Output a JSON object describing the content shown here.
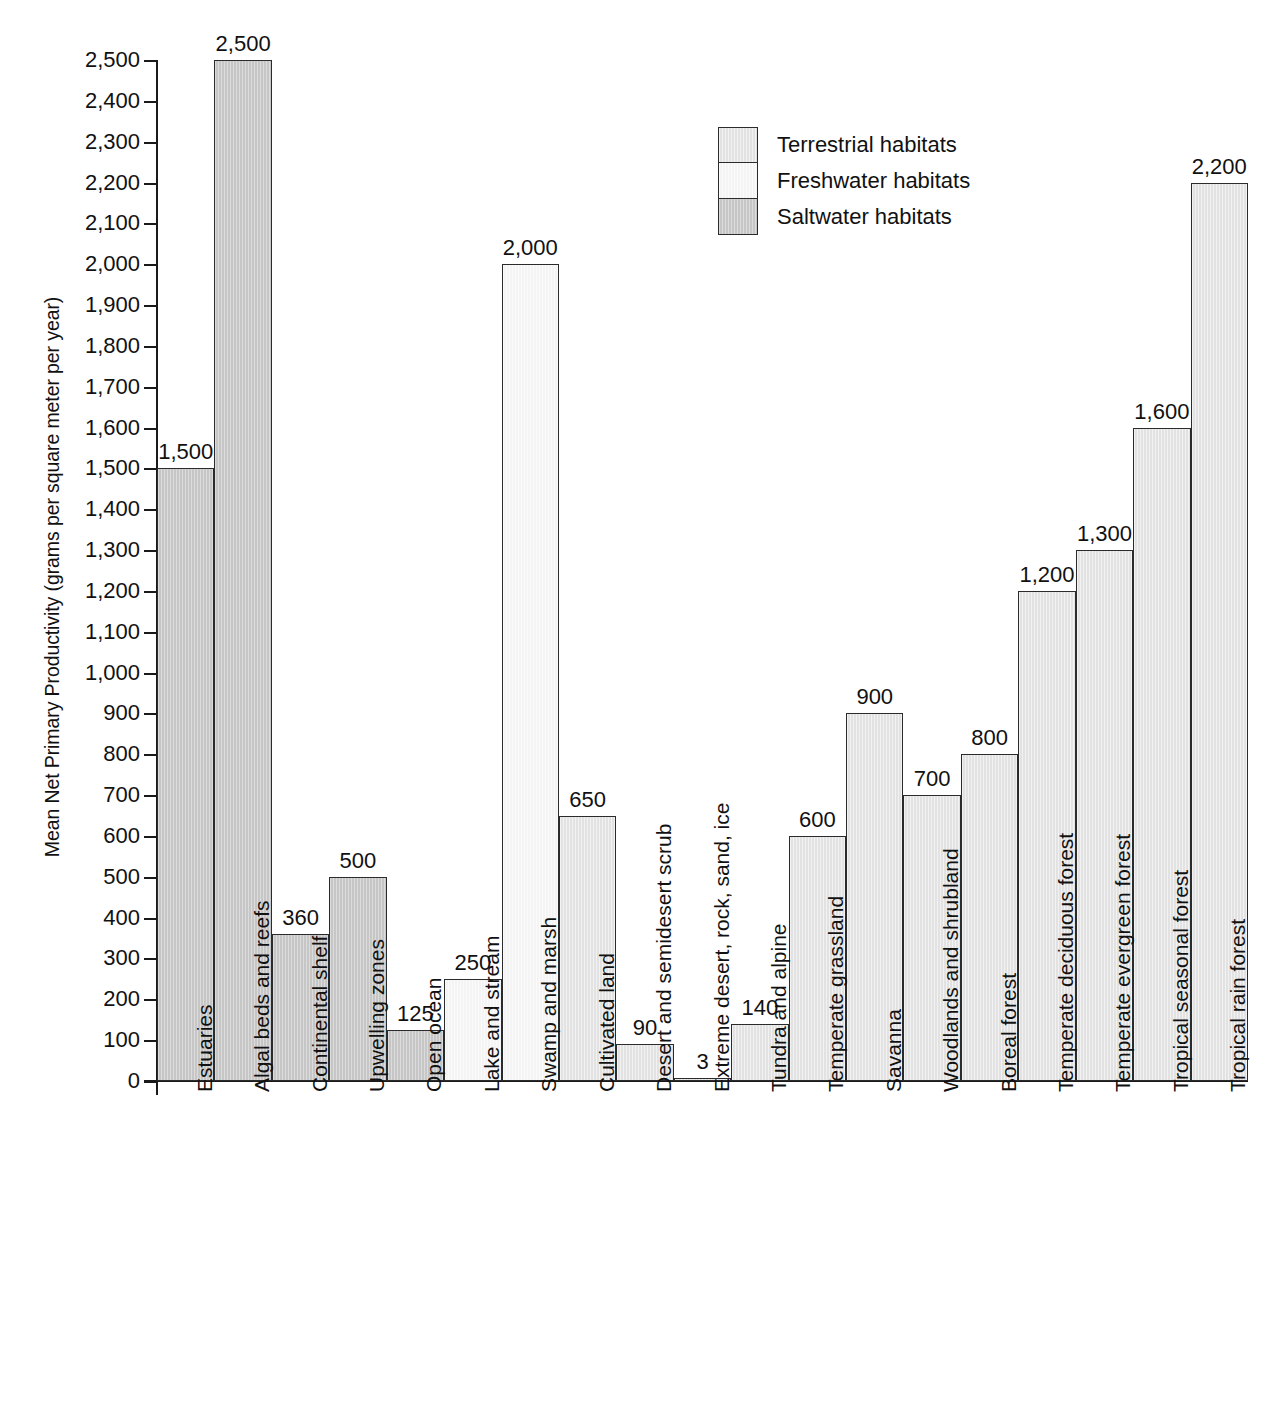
{
  "chart_data": {
    "type": "bar",
    "title": "",
    "xlabel": "",
    "ylabel": "Mean Net Primary Productivity (grams per square meter per year)",
    "ylim": [
      0,
      2500
    ],
    "ytick_step": 100,
    "grid": false,
    "legend_position": "upper-center",
    "bar_value_labels": true,
    "categories": [
      "Estuaries",
      "Algal beds and reefs",
      "Continental shelf",
      "Upwelling zones",
      "Open ocean",
      "Lake and stream",
      "Swamp and marsh",
      "Cultivated land",
      "Desert and semidesert scrub",
      "Extreme desert, rock, sand, ice",
      "Tundra and alpine",
      "Temperate grassland",
      "Savanna",
      "Woodlands and shrubland",
      "Boreal forest",
      "Temperate deciduous forest",
      "Temperate evergreen forest",
      "Tropical seasonal forest",
      "Tropical rain forest"
    ],
    "values": [
      1500,
      2500,
      360,
      500,
      125,
      250,
      2000,
      650,
      90,
      3,
      140,
      600,
      900,
      700,
      800,
      1200,
      1300,
      1600,
      2200
    ],
    "value_labels": [
      "1,500",
      "2,500",
      "360",
      "500",
      "125",
      "250",
      "2,000",
      "650",
      "90",
      "3",
      "140",
      "600",
      "900",
      "700",
      "800",
      "1,200",
      "1,300",
      "1,600",
      "2,200"
    ],
    "habitat_group": [
      "saltwater",
      "saltwater",
      "saltwater",
      "saltwater",
      "saltwater",
      "freshwater",
      "freshwater",
      "terrestrial",
      "terrestrial",
      "terrestrial",
      "terrestrial",
      "terrestrial",
      "terrestrial",
      "terrestrial",
      "terrestrial",
      "terrestrial",
      "terrestrial",
      "terrestrial",
      "terrestrial"
    ],
    "ytick_labels": [
      "0",
      "100",
      "200",
      "300",
      "400",
      "500",
      "600",
      "700",
      "800",
      "900",
      "1,000",
      "1,100",
      "1,200",
      "1,300",
      "1,400",
      "1,500",
      "1,600",
      "1,700",
      "1,800",
      "1,900",
      "2,000",
      "2,100",
      "2,200",
      "2,300",
      "2,400",
      "2,500"
    ],
    "ytick_values": [
      0,
      100,
      200,
      300,
      400,
      500,
      600,
      700,
      800,
      900,
      1000,
      1100,
      1200,
      1300,
      1400,
      1500,
      1600,
      1700,
      1800,
      1900,
      2000,
      2100,
      2200,
      2300,
      2400,
      2500
    ]
  },
  "legend": {
    "items": [
      {
        "label": "Terrestrial habitats",
        "key": "terrestrial",
        "color": "#e2e2e2"
      },
      {
        "label": "Freshwater habitats",
        "key": "freshwater",
        "color": "#f4f4f4"
      },
      {
        "label": "Saltwater habitats",
        "key": "saltwater",
        "color": "#c6c6c6"
      }
    ]
  },
  "colors": {
    "terrestrial": "#e2e2e2",
    "freshwater": "#f4f4f4",
    "saltwater": "#c6c6c6",
    "outline": "#2b2b2b",
    "axis": "#1a1a1a",
    "text": "#111111",
    "background": "#ffffff"
  }
}
